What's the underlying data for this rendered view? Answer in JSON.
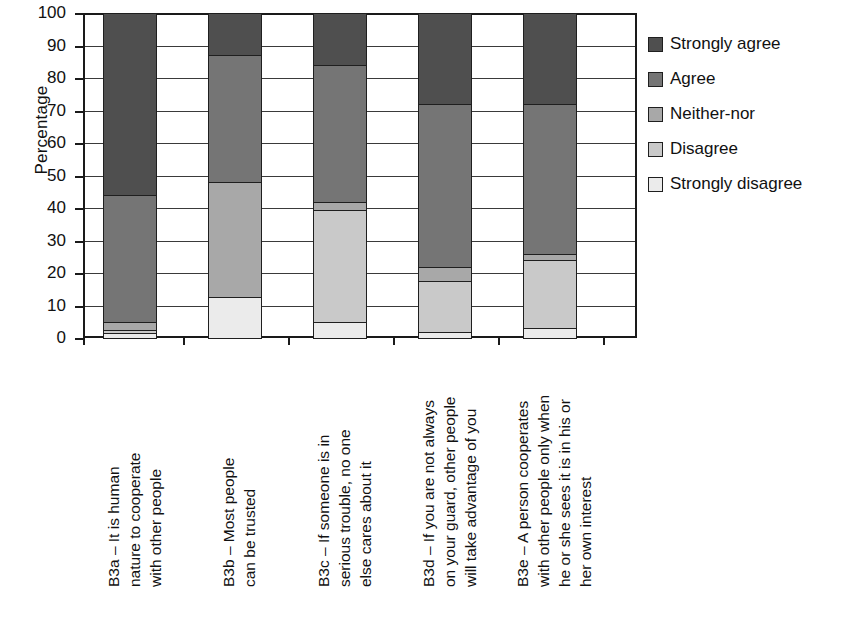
{
  "chart_data": {
    "type": "bar",
    "subtype": "stacked-bar-100",
    "title": "",
    "xlabel": "",
    "ylabel": "Percentage",
    "ylim": [
      0,
      100
    ],
    "yticks": [
      0,
      10,
      20,
      30,
      40,
      50,
      60,
      70,
      80,
      90,
      100
    ],
    "ytick_labels": [
      "0",
      "10",
      "20",
      "30",
      "40",
      "50",
      "60",
      "70",
      "80",
      "90",
      "100"
    ],
    "grid": true,
    "legend_position": "right",
    "categories": [
      "B3a – It is human nature to cooperate with other people",
      "B3b – Most people can be trusted",
      "B3c – If someone is in serious trouble, no one else cares about it",
      "B3d – If you are not always on your guard, other people will take advantage of you",
      "B3e – A person cooperates with other people only when he or she sees it is in his or her own interest"
    ],
    "category_lines": [
      [
        "B3a – It is human",
        "nature to cooperate",
        "with other people"
      ],
      [
        "B3b – Most people",
        "can be trusted"
      ],
      [
        "B3c – If someone is in",
        "serious trouble, no one",
        "else cares about it"
      ],
      [
        "B3d – If you are not always",
        "on your guard, other people",
        "will take advantage of you"
      ],
      [
        "B3e – A person cooperates",
        "with other people only when",
        "he or she sees it is in his or",
        "her own interest"
      ]
    ],
    "series": [
      {
        "name": "Strongly agree",
        "color": "#4f4f4f",
        "values": [
          56.0,
          13.0,
          16.0,
          28.0,
          28.0
        ]
      },
      {
        "name": "Agree",
        "color": "#757575",
        "values": [
          39.0,
          39.0,
          42.0,
          50.0,
          46.0
        ]
      },
      {
        "name": "Neither-nor",
        "color": "#a8a8a8",
        "values": [
          2.5,
          35.5,
          2.5,
          4.5,
          2.0
        ]
      },
      {
        "name": "Disagree",
        "color": "#c9c9c9",
        "values": [
          1.0,
          0.0,
          34.5,
          15.5,
          21.0
        ]
      },
      {
        "name": "Strongly disagree",
        "color": "#ebebeb",
        "values": [
          1.5,
          12.5,
          5.0,
          2.0,
          3.0
        ]
      }
    ],
    "stack_order_bottom_to_top": [
      "Strongly disagree",
      "Disagree",
      "Neither-nor",
      "Agree",
      "Strongly agree"
    ],
    "cumulative_boundaries": {
      "B3a": [
        0,
        1.5,
        2.5,
        5.0,
        44.0,
        100.0
      ],
      "B3b": [
        0,
        12.5,
        12.5,
        48.0,
        87.0,
        100.0
      ],
      "B3c": [
        0,
        5.0,
        39.5,
        42.0,
        84.0,
        100.0
      ],
      "B3d": [
        0,
        2.0,
        17.5,
        22.0,
        72.0,
        100.0
      ],
      "B3e": [
        0,
        3.0,
        24.0,
        26.0,
        72.0,
        100.0
      ]
    }
  },
  "legend": {
    "items": [
      {
        "label": "Strongly agree",
        "color": "#4f4f4f"
      },
      {
        "label": "Agree",
        "color": "#757575"
      },
      {
        "label": "Neither-nor",
        "color": "#a8a8a8"
      },
      {
        "label": "Disagree",
        "color": "#c9c9c9"
      },
      {
        "label": "Strongly disagree",
        "color": "#ebebeb"
      }
    ]
  }
}
